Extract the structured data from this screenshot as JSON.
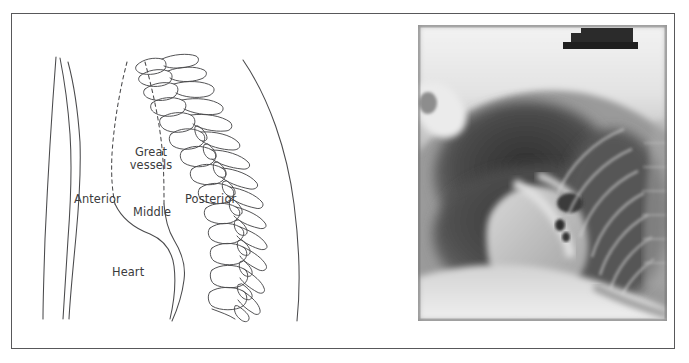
{
  "figure": {
    "kind": "medical-figure",
    "border_color": "#58585a",
    "background": "#ffffff"
  },
  "diagram": {
    "line_color": "#4a4a4c",
    "labels": {
      "great_vessels": "Great vessels",
      "anterior": "Anterior",
      "middle": "Middle",
      "posterior": "Posterior",
      "heart": "Heart"
    },
    "structures": [
      "anterior chest wall",
      "sternum",
      "great vessels compartment",
      "heart silhouette",
      "thoracic vertebral column",
      "posterior chest wall"
    ],
    "compartment_dividers": "dashed"
  },
  "xray": {
    "view": "lateral chest radiograph",
    "marker_color": "#2b2b2b",
    "regions": [
      "retrosternal clear space",
      "cardiac silhouette",
      "hilar structures",
      "thoracic spine",
      "diaphragm",
      "posterior costophrenic recess"
    ]
  }
}
